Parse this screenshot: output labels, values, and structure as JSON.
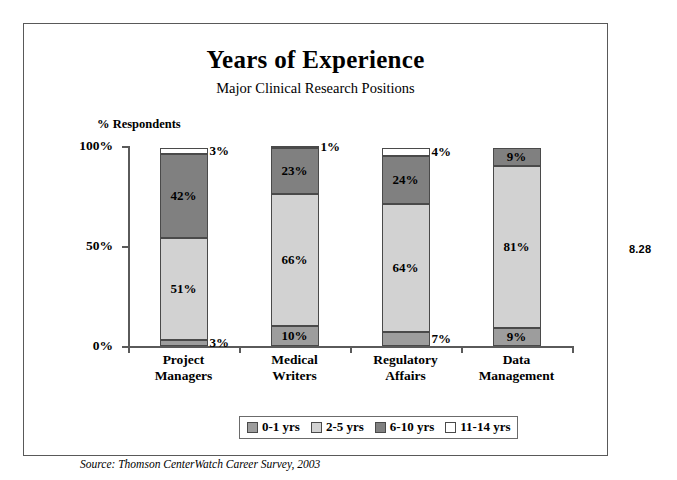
{
  "figure": {
    "number": "8.28",
    "source_note": "Source:  Thomson CenterWatch Career Survey, 2003"
  },
  "chart_data": {
    "type": "bar",
    "subtype": "stacked-column-100",
    "title": "Years of Experience",
    "subtitle": "Major Clinical Research Positions",
    "xlabel": "",
    "ylabel": "% Respondents",
    "ylim": [
      0,
      100
    ],
    "yticks": [
      0,
      50,
      100
    ],
    "ytick_labels": [
      "0%",
      "50%",
      "100%"
    ],
    "grid": false,
    "legend_position": "bottom",
    "categories": [
      "Project Managers",
      "Medical Writers",
      "Regulatory Affairs",
      "Data Management"
    ],
    "category_lines": [
      [
        "Project",
        "Managers"
      ],
      [
        "Medical",
        "Writers"
      ],
      [
        "Regulatory",
        "Affairs"
      ],
      [
        "Data",
        "Management"
      ]
    ],
    "series": [
      {
        "name": "0-1 yrs",
        "color": "#9d9d9d",
        "values": [
          3,
          10,
          7,
          9
        ],
        "labels": [
          "3%",
          "10%",
          "7%",
          "9%"
        ]
      },
      {
        "name": "2-5 yrs",
        "color": "#d2d2d2",
        "values": [
          51,
          66,
          64,
          81
        ],
        "labels": [
          "51%",
          "66%",
          "64%",
          "81%"
        ]
      },
      {
        "name": "6-10 yrs",
        "color": "#808080",
        "values": [
          42,
          23,
          24,
          9
        ],
        "labels": [
          "42%",
          "23%",
          "24%",
          "9%"
        ]
      },
      {
        "name": "11-14 yrs",
        "color": "#ffffff",
        "values": [
          3,
          1,
          4,
          0
        ],
        "labels": [
          "3%",
          "1%",
          "4%",
          ""
        ]
      }
    ],
    "legend_entries": [
      {
        "label": "0-1 yrs",
        "color": "#9d9d9d"
      },
      {
        "label": "2-5 yrs",
        "color": "#d2d2d2"
      },
      {
        "label": "6-10 yrs",
        "color": "#808080"
      },
      {
        "label": "11-14 yrs",
        "color": "#ffffff"
      }
    ]
  }
}
